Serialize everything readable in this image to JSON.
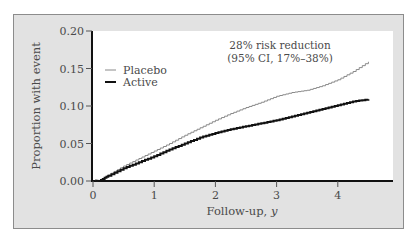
{
  "chart_data": {
    "type": "line",
    "title": "",
    "xlabel": "Follow-up, y",
    "xlabel_main": "Follow-up, ",
    "xlabel_italic": "y",
    "ylabel": "Proportion with event",
    "xlim": [
      0,
      4.9
    ],
    "ylim": [
      0,
      0.2
    ],
    "x_ticks": [
      0,
      1,
      2,
      3,
      4
    ],
    "x_tick_labels": [
      "0",
      "1",
      "2",
      "3",
      "4"
    ],
    "y_ticks": [
      0,
      0.05,
      0.1,
      0.15,
      0.2
    ],
    "y_tick_labels": [
      "0.00",
      "0.05",
      "0.10",
      "0.15",
      "0.20"
    ],
    "grid": false,
    "legend": {
      "position": "upper-left",
      "entries": [
        "Placebo",
        "Active"
      ]
    },
    "annotation": {
      "line1": "28% risk reduction",
      "line2": "(95% CI, 17%–38%)"
    },
    "series": [
      {
        "name": "Placebo",
        "color": "#8a8a8a",
        "step": true,
        "x": [
          0.1,
          0.25,
          0.5,
          0.75,
          1.0,
          1.25,
          1.5,
          1.75,
          2.0,
          2.25,
          2.5,
          2.75,
          3.0,
          3.25,
          3.5,
          3.75,
          4.0,
          4.25,
          4.5
        ],
        "values": [
          0.0,
          0.008,
          0.02,
          0.03,
          0.04,
          0.05,
          0.061,
          0.071,
          0.081,
          0.09,
          0.098,
          0.105,
          0.113,
          0.118,
          0.121,
          0.127,
          0.135,
          0.146,
          0.159
        ]
      },
      {
        "name": "Active",
        "color": "#111111",
        "step": true,
        "x": [
          0.1,
          0.25,
          0.5,
          0.75,
          1.0,
          1.25,
          1.5,
          1.75,
          2.0,
          2.25,
          2.5,
          2.75,
          3.0,
          3.25,
          3.5,
          3.75,
          4.0,
          4.25,
          4.5
        ],
        "values": [
          0.0,
          0.007,
          0.017,
          0.025,
          0.033,
          0.042,
          0.05,
          0.058,
          0.064,
          0.069,
          0.073,
          0.077,
          0.081,
          0.086,
          0.091,
          0.096,
          0.101,
          0.106,
          0.109
        ]
      }
    ]
  }
}
